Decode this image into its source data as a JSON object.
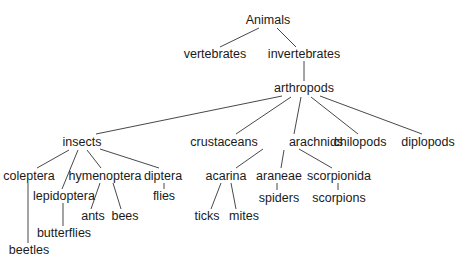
{
  "diagram": {
    "type": "tree",
    "line_color": "#333333",
    "text_color": "#1a1a1a",
    "nodes": [
      {
        "id": "animals",
        "label": "Animals",
        "x": 268,
        "y": 20
      },
      {
        "id": "vertebrates",
        "label": "vertebrates",
        "x": 215,
        "y": 54
      },
      {
        "id": "invertebrates",
        "label": "invertebrates",
        "x": 304,
        "y": 54
      },
      {
        "id": "arthropods",
        "label": "arthropods",
        "x": 304,
        "y": 88
      },
      {
        "id": "insects",
        "label": "insects",
        "x": 82,
        "y": 142
      },
      {
        "id": "crustaceans",
        "label": "crustaceans",
        "x": 224,
        "y": 142
      },
      {
        "id": "arachnids",
        "label": "arachnids",
        "x": 316,
        "y": 142
      },
      {
        "id": "chilopods",
        "label": "chilopods",
        "x": 360,
        "y": 142
      },
      {
        "id": "diplopods",
        "label": "diplopods",
        "x": 428,
        "y": 142
      },
      {
        "id": "coleptera",
        "label": "coleptera",
        "x": 29,
        "y": 176
      },
      {
        "id": "hymenoptera",
        "label": "hymenoptera",
        "x": 105,
        "y": 176
      },
      {
        "id": "diptera",
        "label": "diptera",
        "x": 163,
        "y": 176
      },
      {
        "id": "lepidoptera",
        "label": "lepidoptera",
        "x": 64,
        "y": 196
      },
      {
        "id": "flies",
        "label": "flies",
        "x": 164,
        "y": 196
      },
      {
        "id": "ants",
        "label": "ants",
        "x": 93,
        "y": 216
      },
      {
        "id": "bees",
        "label": "bees",
        "x": 125,
        "y": 216
      },
      {
        "id": "butterflies",
        "label": "butterflies",
        "x": 64,
        "y": 233
      },
      {
        "id": "beetles",
        "label": "beetles",
        "x": 29,
        "y": 250
      },
      {
        "id": "acarina",
        "label": "acarina",
        "x": 226,
        "y": 176
      },
      {
        "id": "araneae",
        "label": "araneae",
        "x": 279,
        "y": 176
      },
      {
        "id": "scorpionida",
        "label": "scorpionida",
        "x": 339,
        "y": 176
      },
      {
        "id": "spiders",
        "label": "spiders",
        "x": 279,
        "y": 198
      },
      {
        "id": "scorpions",
        "label": "scorpions",
        "x": 339,
        "y": 198
      },
      {
        "id": "ticks",
        "label": "ticks",
        "x": 207,
        "y": 216
      },
      {
        "id": "mites",
        "label": "mites",
        "x": 244,
        "y": 216
      }
    ],
    "edges": [
      {
        "from": "animals",
        "to": "vertebrates",
        "x1": 259,
        "y1": 28,
        "x2": 220,
        "y2": 47
      },
      {
        "from": "animals",
        "to": "invertebrates",
        "x1": 277,
        "y1": 28,
        "x2": 296,
        "y2": 47
      },
      {
        "from": "invertebrates",
        "to": "arthropods",
        "x1": 304,
        "y1": 61,
        "x2": 304,
        "y2": 81
      },
      {
        "from": "arthropods",
        "to": "insects",
        "x1": 282,
        "y1": 96,
        "x2": 96,
        "y2": 134
      },
      {
        "from": "arthropods",
        "to": "crustaceans",
        "x1": 291,
        "y1": 97,
        "x2": 236,
        "y2": 134
      },
      {
        "from": "arthropods",
        "to": "arachnids",
        "x1": 301,
        "y1": 97,
        "x2": 294,
        "y2": 134
      },
      {
        "from": "arthropods",
        "to": "chilopods",
        "x1": 311,
        "y1": 97,
        "x2": 358,
        "y2": 134
      },
      {
        "from": "arthropods",
        "to": "diplopods",
        "x1": 320,
        "y1": 96,
        "x2": 422,
        "y2": 134
      },
      {
        "from": "insects",
        "to": "coleptera",
        "x1": 69,
        "y1": 150,
        "x2": 37,
        "y2": 168
      },
      {
        "from": "insects",
        "to": "lepidoptera",
        "x1": 78,
        "y1": 150,
        "x2": 62,
        "y2": 189
      },
      {
        "from": "insects",
        "to": "hymenoptera",
        "x1": 87,
        "y1": 150,
        "x2": 101,
        "y2": 168
      },
      {
        "from": "insects",
        "to": "diptera",
        "x1": 100,
        "y1": 149,
        "x2": 159,
        "y2": 168
      },
      {
        "from": "coleptera",
        "to": "beetles",
        "x1": 28,
        "y1": 183,
        "x2": 28,
        "y2": 243
      },
      {
        "from": "lepidoptera",
        "to": "butterflies",
        "x1": 63,
        "y1": 203,
        "x2": 63,
        "y2": 226
      },
      {
        "from": "hymenoptera",
        "to": "ants",
        "x1": 100,
        "y1": 183,
        "x2": 91,
        "y2": 209
      },
      {
        "from": "hymenoptera",
        "to": "bees",
        "x1": 113,
        "y1": 183,
        "x2": 121,
        "y2": 209
      },
      {
        "from": "diptera",
        "to": "flies",
        "x1": 164,
        "y1": 183,
        "x2": 164,
        "y2": 189
      },
      {
        "from": "arachnids",
        "to": "acarina",
        "x1": 263,
        "y1": 149,
        "x2": 236,
        "y2": 168
      },
      {
        "from": "arachnids",
        "to": "araneae",
        "x1": 284,
        "y1": 150,
        "x2": 281,
        "y2": 168
      },
      {
        "from": "arachnids",
        "to": "scorpionida",
        "x1": 299,
        "y1": 149,
        "x2": 332,
        "y2": 168
      },
      {
        "from": "acarina",
        "to": "ticks",
        "x1": 221,
        "y1": 183,
        "x2": 211,
        "y2": 209
      },
      {
        "from": "acarina",
        "to": "mites",
        "x1": 231,
        "y1": 183,
        "x2": 236,
        "y2": 209
      },
      {
        "from": "araneae",
        "to": "spiders",
        "x1": 277,
        "y1": 183,
        "x2": 277,
        "y2": 190
      },
      {
        "from": "scorpionida",
        "to": "scorpions",
        "x1": 338,
        "y1": 183,
        "x2": 338,
        "y2": 190
      }
    ]
  }
}
